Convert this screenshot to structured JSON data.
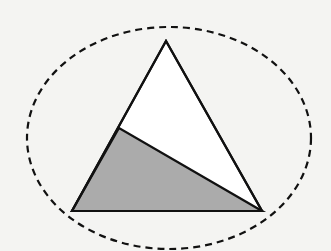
{
  "diagram": {
    "type": "geometry",
    "background_color": "#f4f4f2",
    "ellipse": {
      "cx": 169,
      "cy": 138,
      "rx": 142,
      "ry": 111,
      "stroke": "#111111",
      "stroke_style": "dashed"
    },
    "triangle": {
      "vertices": {
        "top": [
          166,
          41
        ],
        "bottom_left": [
          72,
          211
        ],
        "bottom_right": [
          262,
          211
        ]
      },
      "fill": "#ffffff",
      "stroke": "#111111"
    },
    "interior_point_on_left_edge": [
      119,
      128
    ],
    "shaded_region": {
      "vertices": [
        [
          72,
          211
        ],
        [
          119,
          128
        ],
        [
          262,
          211
        ]
      ],
      "fill": "#ababab"
    }
  }
}
